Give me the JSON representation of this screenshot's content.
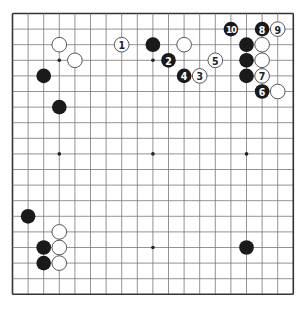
{
  "board": {
    "size": 19,
    "origin_x": 12.5,
    "origin_y": 13.5,
    "spacing": 15.6,
    "line_color": "#777777",
    "edge_color": "#333333",
    "hoshi": [
      [
        3,
        3
      ],
      [
        9,
        3
      ],
      [
        15,
        3
      ],
      [
        3,
        9
      ],
      [
        9,
        9
      ],
      [
        15,
        9
      ],
      [
        3,
        15
      ],
      [
        9,
        15
      ],
      [
        15,
        15
      ]
    ]
  },
  "stones": [
    {
      "color": "white",
      "col": 3,
      "row": 2,
      "label": ""
    },
    {
      "color": "white",
      "col": 4,
      "row": 3,
      "label": ""
    },
    {
      "color": "black",
      "col": 2,
      "row": 4,
      "label": ""
    },
    {
      "color": "black",
      "col": 3,
      "row": 6,
      "label": ""
    },
    {
      "color": "white",
      "col": 7,
      "row": 2,
      "label": "1"
    },
    {
      "color": "black",
      "col": 9,
      "row": 2,
      "label": ""
    },
    {
      "color": "white",
      "col": 11,
      "row": 2,
      "label": ""
    },
    {
      "color": "black",
      "col": 10,
      "row": 3,
      "label": "2"
    },
    {
      "color": "white",
      "col": 12,
      "row": 4,
      "label": "3"
    },
    {
      "color": "black",
      "col": 11,
      "row": 4,
      "label": "4"
    },
    {
      "color": "white",
      "col": 13,
      "row": 3,
      "label": "5"
    },
    {
      "color": "black",
      "col": 16,
      "row": 5,
      "label": "6"
    },
    {
      "color": "white",
      "col": 16,
      "row": 4,
      "label": "7"
    },
    {
      "color": "black",
      "col": 16,
      "row": 1,
      "label": "8"
    },
    {
      "color": "white",
      "col": 17,
      "row": 1,
      "label": "9"
    },
    {
      "color": "black",
      "col": 14,
      "row": 1,
      "label": "10"
    },
    {
      "color": "black",
      "col": 15,
      "row": 2,
      "label": ""
    },
    {
      "color": "white",
      "col": 16,
      "row": 2,
      "label": ""
    },
    {
      "color": "black",
      "col": 15,
      "row": 3,
      "label": ""
    },
    {
      "color": "white",
      "col": 16,
      "row": 3,
      "label": ""
    },
    {
      "color": "black",
      "col": 15,
      "row": 4,
      "label": ""
    },
    {
      "color": "white",
      "col": 17,
      "row": 5,
      "label": ""
    },
    {
      "color": "black",
      "col": 1,
      "row": 13,
      "label": ""
    },
    {
      "color": "white",
      "col": 3,
      "row": 14,
      "label": ""
    },
    {
      "color": "black",
      "col": 2,
      "row": 15,
      "label": ""
    },
    {
      "color": "white",
      "col": 3,
      "row": 15,
      "label": ""
    },
    {
      "color": "black",
      "col": 2,
      "row": 16,
      "label": ""
    },
    {
      "color": "white",
      "col": 3,
      "row": 16,
      "label": ""
    },
    {
      "color": "black",
      "col": 15,
      "row": 15,
      "label": ""
    }
  ],
  "colors": {
    "black": "#1a1a1a",
    "white": "#ffffff",
    "stone_outline": "#444444"
  }
}
